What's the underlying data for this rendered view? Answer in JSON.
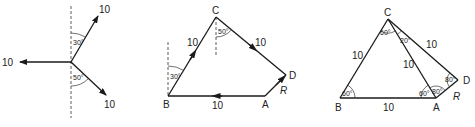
{
  "diagram1": {
    "forces": [
      {
        "label": "10",
        "direction": "up-right",
        "angle_from_vertical": "30°"
      },
      {
        "label": "10",
        "direction": "left"
      },
      {
        "label": "10",
        "direction": "down-right",
        "angle_from_vertical": "50°"
      }
    ],
    "angles": [
      "30°",
      "50°"
    ]
  },
  "diagram2": {
    "points": {
      "A": "A",
      "B": "B",
      "C": "C",
      "D": "D"
    },
    "sides": {
      "AB": "10",
      "BC": "10",
      "CD": "10"
    },
    "resultant": "R",
    "angles": {
      "B": "30°",
      "C": "50°"
    }
  },
  "diagram3": {
    "points": {
      "A": "A",
      "B": "B",
      "C": "C",
      "D": "D"
    },
    "sides": {
      "AB": "10",
      "BC": "10",
      "CA": "10",
      "CD": "10"
    },
    "resultant": "R",
    "angles": {
      "B": "60°",
      "C_left": "60°",
      "C_right": "20°",
      "A_left": "60°",
      "A_right": "80°",
      "D": "80°"
    }
  }
}
